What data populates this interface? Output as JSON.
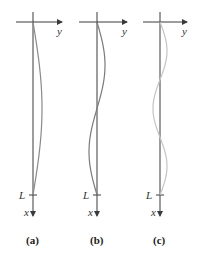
{
  "figure": {
    "panels": [
      {
        "id": "a",
        "caption": "(a)",
        "axis_x": 33,
        "mode_halfwaves": 1,
        "amplitude": 9,
        "curve_color": "#8a8a8a",
        "labels": {
          "horizontal": "y",
          "vertical": "x",
          "length": "L"
        }
      },
      {
        "id": "b",
        "caption": "(b)",
        "axis_x": 97,
        "mode_halfwaves": 2,
        "amplitude": 8,
        "curve_color": "#7a7a7a",
        "labels": {
          "horizontal": "y",
          "vertical": "x",
          "length": "L"
        }
      },
      {
        "id": "c",
        "caption": "(c)",
        "axis_x": 160,
        "mode_halfwaves": 3,
        "amplitude": 7,
        "curve_color": "#c4c4c4",
        "labels": {
          "horizontal": "y",
          "vertical": "x",
          "length": "L"
        }
      }
    ],
    "geometry": {
      "top_y": 22,
      "bottom_y": 195,
      "arrow_end_y": 216,
      "h_axis_left_offset": -17,
      "h_axis_right_offset": 28
    }
  }
}
